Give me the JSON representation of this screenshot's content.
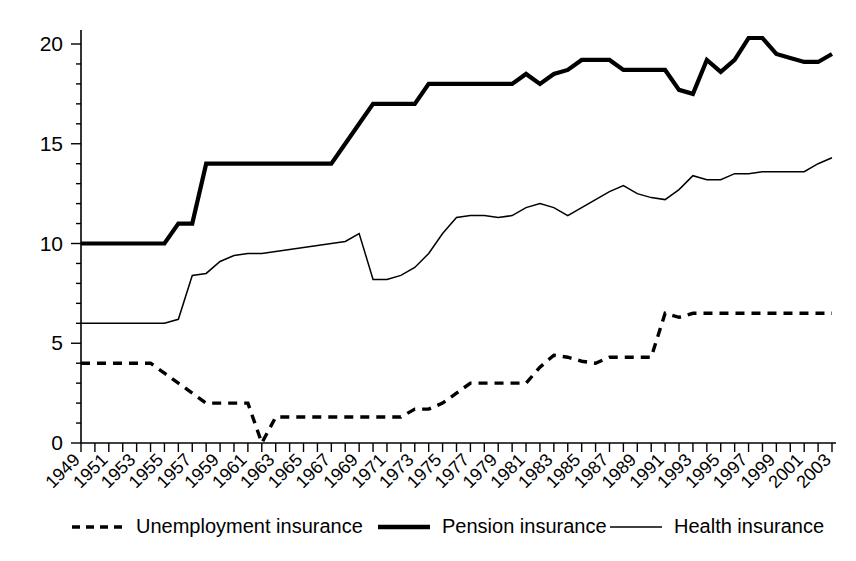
{
  "chart_data": {
    "type": "line",
    "title": "",
    "subtitle": "",
    "xlabel": "",
    "ylabel": "",
    "xlim": [
      1949,
      2003
    ],
    "ylim": [
      0,
      20
    ],
    "grid": false,
    "legend_position": "bottom",
    "y_ticks": [
      "0",
      "5",
      "10",
      "15",
      "20"
    ],
    "y_tick_values": [
      0,
      5,
      10,
      15,
      20
    ],
    "y_minor_tick_step": 1,
    "x_tick_labels": [
      "1949",
      "1951",
      "1953",
      "1955",
      "1957",
      "1959",
      "1961",
      "1963",
      "1965",
      "1967",
      "1969",
      "1971",
      "1973",
      "1975",
      "1977",
      "1979",
      "1981",
      "1983",
      "1985",
      "1987",
      "1989",
      "1991",
      "1993",
      "1995",
      "1997",
      "1999",
      "2001",
      "2003"
    ],
    "x_tick_label_rotation_deg": -45,
    "x_minor_tick_step": 1,
    "x": [
      1949,
      1950,
      1951,
      1952,
      1953,
      1954,
      1955,
      1956,
      1957,
      1958,
      1959,
      1960,
      1961,
      1962,
      1963,
      1964,
      1965,
      1966,
      1967,
      1968,
      1969,
      1970,
      1971,
      1972,
      1973,
      1974,
      1975,
      1976,
      1977,
      1978,
      1979,
      1980,
      1981,
      1982,
      1983,
      1984,
      1985,
      1986,
      1987,
      1988,
      1989,
      1990,
      1991,
      1992,
      1993,
      1994,
      1995,
      1996,
      1997,
      1998,
      1999,
      2000,
      2001,
      2002,
      2003
    ],
    "series": [
      {
        "name": "Unemployment insurance",
        "style": "dashed",
        "line_width": "medium",
        "values": [
          4.0,
          4.0,
          4.0,
          4.0,
          4.0,
          4.0,
          3.5,
          3.0,
          2.5,
          2.0,
          2.0,
          2.0,
          2.0,
          0.0,
          1.3,
          1.3,
          1.3,
          1.3,
          1.3,
          1.3,
          1.3,
          1.3,
          1.3,
          1.3,
          1.7,
          1.7,
          2.0,
          2.5,
          3.0,
          3.0,
          3.0,
          3.0,
          3.0,
          3.8,
          4.4,
          4.3,
          4.1,
          4.0,
          4.3,
          4.3,
          4.3,
          4.3,
          6.5,
          6.3,
          6.5,
          6.5,
          6.5,
          6.5,
          6.5,
          6.5,
          6.5,
          6.5,
          6.5,
          6.5,
          6.5
        ]
      },
      {
        "name": "Pension insurance",
        "style": "solid",
        "line_width": "thick",
        "values": [
          10.0,
          10.0,
          10.0,
          10.0,
          10.0,
          10.0,
          10.0,
          11.0,
          11.0,
          14.0,
          14.0,
          14.0,
          14.0,
          14.0,
          14.0,
          14.0,
          14.0,
          14.0,
          14.0,
          15.0,
          16.0,
          17.0,
          17.0,
          17.0,
          17.0,
          18.0,
          18.0,
          18.0,
          18.0,
          18.0,
          18.0,
          18.0,
          18.5,
          18.0,
          18.5,
          18.7,
          19.2,
          19.2,
          19.2,
          18.7,
          18.7,
          18.7,
          18.7,
          17.7,
          17.5,
          19.2,
          18.6,
          19.2,
          20.3,
          20.3,
          19.5,
          19.3,
          19.1,
          19.1,
          19.5
        ]
      },
      {
        "name": "Health insurance",
        "style": "solid",
        "line_width": "thin",
        "values": [
          6.0,
          6.0,
          6.0,
          6.0,
          6.0,
          6.0,
          6.0,
          6.2,
          8.4,
          8.5,
          9.1,
          9.4,
          9.5,
          9.5,
          9.6,
          9.7,
          9.8,
          9.9,
          10.0,
          10.1,
          10.5,
          8.2,
          8.2,
          8.4,
          8.8,
          9.5,
          10.5,
          11.3,
          11.4,
          11.4,
          11.3,
          11.4,
          11.8,
          12.0,
          11.8,
          11.4,
          11.8,
          12.2,
          12.6,
          12.9,
          12.5,
          12.3,
          12.2,
          12.7,
          13.4,
          13.2,
          13.2,
          13.5,
          13.5,
          13.6,
          13.6,
          13.6,
          13.6,
          14.0,
          14.3
        ]
      }
    ]
  },
  "legend": {
    "items": [
      {
        "label": "Unemployment insurance",
        "marker": "dashed-line-swatch"
      },
      {
        "label": "Pension insurance",
        "marker": "thick-line-swatch"
      },
      {
        "label": "Health insurance",
        "marker": "thin-line-swatch"
      }
    ]
  },
  "colors": {
    "foreground": "#000000",
    "background": "#ffffff"
  }
}
